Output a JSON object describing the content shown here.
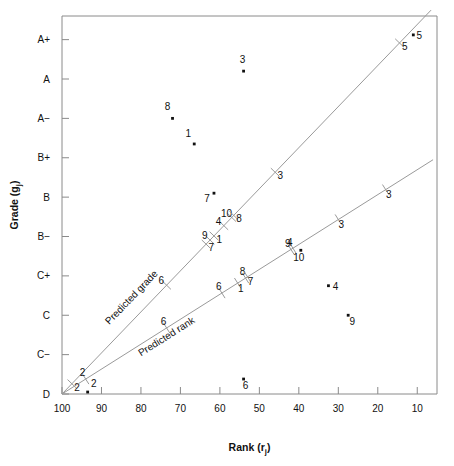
{
  "chart_data": {
    "type": "scatter",
    "title": "",
    "xlabel": "Rank (rj)",
    "ylabel": "Grade (gj)",
    "xlabel_main": "Rank",
    "xlabel_var": "r",
    "xlabel_sub": "j",
    "ylabel_main": "Grade",
    "ylabel_var": "g",
    "ylabel_sub": "j",
    "xlim": [
      100,
      5
    ],
    "xticks": [
      100,
      90,
      80,
      70,
      60,
      50,
      40,
      30,
      20,
      10
    ],
    "xticklabels": [
      "100",
      "90",
      "80",
      "70",
      "60",
      "50",
      "40",
      "30",
      "20",
      "10"
    ],
    "x_axis_reversed": true,
    "yticks": [
      0,
      1,
      2,
      3,
      4,
      5,
      6,
      7,
      8,
      9
    ],
    "yticklabels": [
      "D",
      "C−",
      "C",
      "C+",
      "B−",
      "B",
      "B+",
      "A−",
      "A",
      "A+"
    ],
    "ylim": [
      0,
      9.6
    ],
    "grid": false,
    "legend_position": "inline-line-labels",
    "points": [
      {
        "label": "8",
        "x": 72,
        "y": 7.0,
        "lx": -5,
        "ly": -8
      },
      {
        "label": "1",
        "x": 66.5,
        "y": 6.35,
        "lx": -6,
        "ly": -7
      },
      {
        "label": "3",
        "x": 54,
        "y": 8.2,
        "lx": -1,
        "ly": -8
      },
      {
        "label": "5",
        "x": 11,
        "y": 9.12,
        "lx": 6,
        "ly": 4
      },
      {
        "label": "7",
        "x": 61.5,
        "y": 5.1,
        "lx": -7,
        "ly": 9
      },
      {
        "label": "10",
        "x": 39.5,
        "y": 3.65,
        "lx": -2,
        "ly": 11
      },
      {
        "label": "4",
        "x": 32.5,
        "y": 2.75,
        "lx": 7,
        "ly": 4
      },
      {
        "label": "9",
        "x": 27.5,
        "y": 2.0,
        "lx": 4,
        "ly": 10
      },
      {
        "label": "6",
        "x": 54,
        "y": 0.38,
        "lx": 2,
        "ly": 10
      },
      {
        "label": "2",
        "x": 93.5,
        "y": 0.05,
        "lx": 6,
        "ly": -5
      }
    ],
    "lines": [
      {
        "name": "Predicted grade",
        "x0": 100,
        "y0": 0.0,
        "x1": 6.5,
        "y1": 9.75,
        "label_x": 88,
        "label_y": 1.75,
        "ticks": [
          {
            "label": "2",
            "x": 97.5,
            "side": "left"
          },
          {
            "label": "6",
            "x": 73.5,
            "side": "right"
          },
          {
            "label": "9",
            "x": 62.5,
            "side": "right"
          },
          {
            "label": "7",
            "x": 63.5,
            "side": "left"
          },
          {
            "label": "1",
            "x": 61.5,
            "side": "left"
          },
          {
            "label": "4",
            "x": 59.0,
            "side": "right"
          },
          {
            "label": "10",
            "x": 57.0,
            "side": "right"
          },
          {
            "label": "8",
            "x": 56.5,
            "side": "left"
          },
          {
            "label": "3",
            "x": 46.0,
            "side": "left"
          },
          {
            "label": "5",
            "x": 14.5,
            "side": "left"
          }
        ]
      },
      {
        "name": "Predicted rank",
        "x0": 100,
        "y0": 0.0,
        "x1": 6.0,
        "y1": 5.95,
        "label_x": 80,
        "label_y": 0.95,
        "ticks": [
          {
            "label": "2",
            "x": 94.0,
            "side": "right"
          },
          {
            "label": "6",
            "x": 73.5,
            "side": "right"
          },
          {
            "label": "6",
            "x": 59.5,
            "side": "right"
          },
          {
            "label": "8",
            "x": 53.5,
            "side": "right"
          },
          {
            "label": "1",
            "x": 55.5,
            "side": "left"
          },
          {
            "label": "7",
            "x": 53.0,
            "side": "left"
          },
          {
            "label": "9",
            "x": 42.0,
            "side": "right"
          },
          {
            "label": "4",
            "x": 41.5,
            "side": "right"
          },
          {
            "label": "3",
            "x": 30.0,
            "side": "left"
          },
          {
            "label": "3",
            "x": 18.0,
            "side": "left"
          }
        ]
      }
    ]
  },
  "colors": {
    "axis": "#8a8a8a",
    "line": "#9a9a9a",
    "point": "#111111",
    "text": "#111111",
    "background": "#ffffff"
  }
}
